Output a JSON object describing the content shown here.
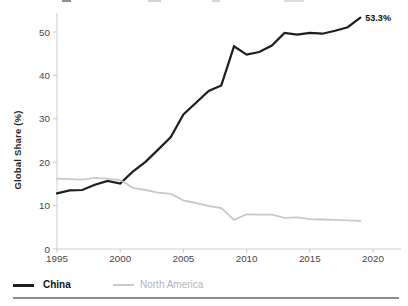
{
  "chart_data": {
    "type": "line",
    "ylabel": "Global Share (%)",
    "xlabel": "",
    "x": [
      1995,
      1996,
      1997,
      1998,
      1999,
      2000,
      2001,
      2002,
      2003,
      2004,
      2005,
      2006,
      2007,
      2008,
      2009,
      2010,
      2011,
      2012,
      2013,
      2014,
      2015,
      2016,
      2017,
      2018,
      2019
    ],
    "series": [
      {
        "name": "China",
        "line_color": "#1e1e1e",
        "label_color": "#141414",
        "values": [
          12.8,
          13.5,
          13.6,
          14.8,
          15.7,
          15.1,
          17.8,
          20.1,
          22.9,
          25.8,
          31.0,
          33.7,
          36.4,
          37.7,
          46.7,
          44.8,
          45.4,
          46.9,
          49.8,
          49.4,
          49.8,
          49.6,
          50.3,
          51.1,
          53.3
        ]
      },
      {
        "name": "North America",
        "line_color": "#c9c9c9",
        "label_color": "#b4b4b4",
        "values": [
          16.2,
          16.1,
          16.0,
          16.4,
          16.2,
          15.9,
          14.1,
          13.6,
          13.0,
          12.7,
          11.2,
          10.6,
          9.9,
          9.4,
          6.7,
          8.0,
          7.9,
          7.9,
          7.2,
          7.3,
          6.9,
          6.8,
          6.7,
          6.6,
          6.5
        ]
      }
    ],
    "end_label": "53.3%",
    "xticks": [
      1995,
      2000,
      2005,
      2010,
      2015,
      2020
    ],
    "yticks": [
      0,
      10,
      20,
      30,
      40,
      50
    ],
    "xlim": [
      1995,
      2020
    ],
    "ylim": [
      0,
      55
    ],
    "grid": false,
    "legend_position": "bottom",
    "axis_color": "#cfcfcf",
    "tick_label_color": "#464646"
  }
}
